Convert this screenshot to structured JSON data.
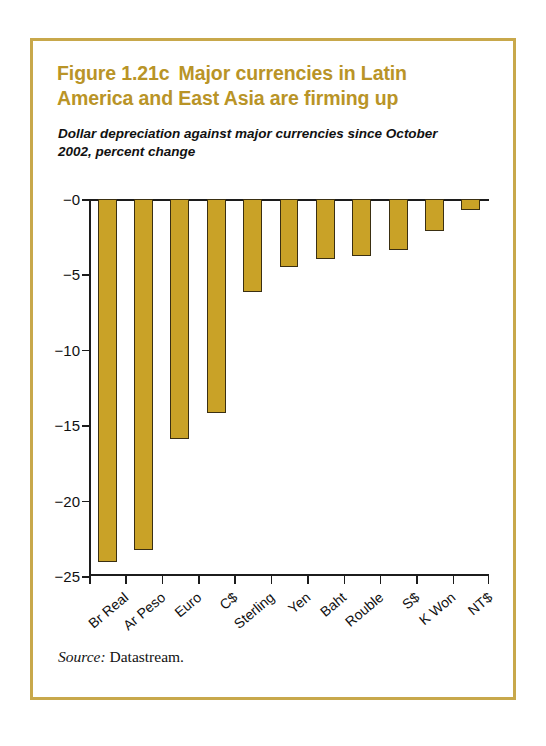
{
  "figure": {
    "title_part1": "Figure 1.21c",
    "title_part2": "Major currencies in Latin America and East Asia are firming up",
    "subtitle": "Dollar depreciation against major currencies since October 2002, percent change",
    "source_label": "Source:",
    "source_value": "Datastream.",
    "frame_color": "#c8a84b",
    "title_color": "#b99427",
    "bar_color": "#c9a227",
    "bar_border_color": "#3a2f12"
  },
  "chart_data": {
    "type": "bar",
    "subtitle": "Dollar depreciation against major currencies since October 2002, percent change",
    "xlabel": "",
    "ylabel": "",
    "ylim": [
      -25,
      0
    ],
    "yticks": [
      0,
      -5,
      -10,
      -15,
      -20,
      -25
    ],
    "ytick_labels": [
      "−0",
      "−5",
      "−10",
      "−15",
      "−20",
      "−25"
    ],
    "grid": false,
    "legend": false,
    "orientation": "vertical",
    "categories": [
      "Br Real",
      "Ar Peso",
      "Euro",
      "C$",
      "Sterling",
      "Yen",
      "Baht",
      "Rouble",
      "S$",
      "K Won",
      "NT$"
    ],
    "values": [
      -24.1,
      -23.3,
      -15.9,
      -14.2,
      -6.2,
      -4.5,
      -4.0,
      -3.8,
      -3.4,
      -2.1,
      -0.7
    ],
    "source": "Datastream."
  }
}
